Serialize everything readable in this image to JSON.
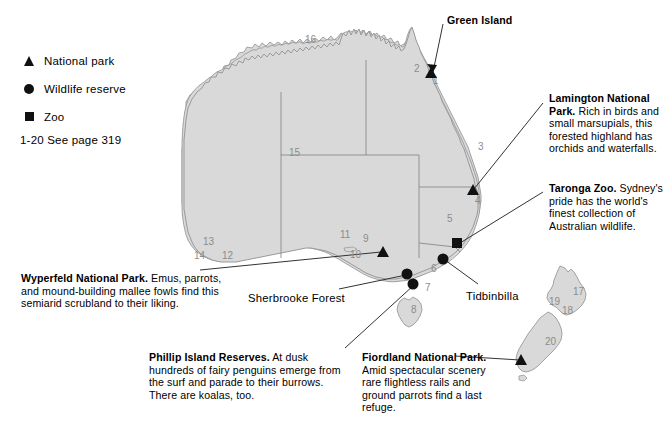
{
  "legend": {
    "items": [
      {
        "symbol": "triangle-marker",
        "label": "National park"
      },
      {
        "symbol": "circle-marker",
        "label": "Wildlife reserve"
      },
      {
        "symbol": "square-marker",
        "label": "Zoo"
      }
    ],
    "note": "1-20 See page 319"
  },
  "colors": {
    "land_fill": "#d9d9d9",
    "land_stroke": "#9a9a9a",
    "marker": "#111111",
    "leader_line": "#333333",
    "map_number": "#8c8c8c",
    "background": "#ffffff"
  },
  "callouts": [
    {
      "id": "green-island",
      "title": "Green Island",
      "body": "",
      "x": 447,
      "y": 14
    },
    {
      "id": "lamington",
      "title": "Lamington National Park.",
      "body": " Rich in birds and small marsupials, this forested highland has orchids and waterfalls.",
      "x": 549,
      "y": 92
    },
    {
      "id": "taronga",
      "title": "Taronga Zoo.",
      "body": " Sydney's pride has the world's finest collection of Australian wildlife.",
      "x": 549,
      "y": 182
    },
    {
      "id": "wyperfeld",
      "title": "Wyperfeld National Park.",
      "body": " Emus, parrots, and mound-building mallee fowls find this semiarid scrubland to their liking.",
      "x": 21,
      "y": 272
    },
    {
      "id": "phillip-island",
      "title": "Phillip Island Reserves.",
      "body": " At dusk hundreds of fairy penguins emerge from the surf and parade to their burrows. There are koalas, too.",
      "x": 149,
      "y": 351
    },
    {
      "id": "fiordland",
      "title": "Fiordland National Park.",
      "body": " Amid spectacular scenery rare flightless rails and ground parrots find a last refuge.",
      "x": 362,
      "y": 351
    }
  ],
  "plain_labels": [
    {
      "id": "sherbrooke-forest",
      "text": "Sherbrooke Forest",
      "x": 248,
      "y": 292
    },
    {
      "id": "tidbinbilla",
      "text": "Tidbinbilla",
      "x": 466,
      "y": 290
    }
  ],
  "map_numbers": [
    {
      "n": "1",
      "x": 433,
      "y": 84
    },
    {
      "n": "2",
      "x": 414,
      "y": 72
    },
    {
      "n": "3",
      "x": 478,
      "y": 150
    },
    {
      "n": "4",
      "x": 475,
      "y": 204
    },
    {
      "n": "5",
      "x": 447,
      "y": 222
    },
    {
      "n": "6",
      "x": 431,
      "y": 272
    },
    {
      "n": "7",
      "x": 425,
      "y": 291
    },
    {
      "n": "8",
      "x": 411,
      "y": 313
    },
    {
      "n": "9",
      "x": 363,
      "y": 242
    },
    {
      "n": "10",
      "x": 350,
      "y": 258
    },
    {
      "n": "11",
      "x": 340,
      "y": 238
    },
    {
      "n": "12",
      "x": 222,
      "y": 259
    },
    {
      "n": "13",
      "x": 203,
      "y": 245
    },
    {
      "n": "14",
      "x": 194,
      "y": 259
    },
    {
      "n": "15",
      "x": 289,
      "y": 156
    },
    {
      "n": "16",
      "x": 305,
      "y": 43
    },
    {
      "n": "17",
      "x": 573,
      "y": 295
    },
    {
      "n": "18",
      "x": 562,
      "y": 314
    },
    {
      "n": "19",
      "x": 549,
      "y": 305
    },
    {
      "n": "20",
      "x": 545,
      "y": 345
    }
  ],
  "markers": [
    {
      "id": "green-island-marker",
      "type": "triangle",
      "x": 431,
      "y": 73
    },
    {
      "id": "lamington-marker",
      "type": "triangle",
      "x": 473,
      "y": 190
    },
    {
      "id": "taronga-zoo-marker",
      "type": "square",
      "x": 457,
      "y": 243
    },
    {
      "id": "wyperfeld-marker",
      "type": "triangle",
      "x": 383,
      "y": 252
    },
    {
      "id": "tidbinbilla-marker",
      "type": "circle",
      "x": 443,
      "y": 259
    },
    {
      "id": "sherbrooke-forest-marker",
      "type": "circle",
      "x": 407,
      "y": 274
    },
    {
      "id": "phillip-island-marker",
      "type": "circle",
      "x": 413,
      "y": 284
    },
    {
      "id": "fiordland-marker",
      "type": "triangle",
      "x": 521,
      "y": 360
    }
  ]
}
